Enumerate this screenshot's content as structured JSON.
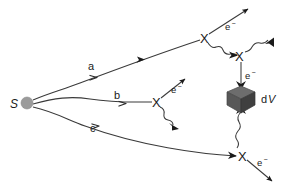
{
  "figure": {
    "background_color": "#ffffff",
    "line_color": "#3a3a3a",
    "label_color": "#1a1a1a",
    "width": 287,
    "height": 191
  },
  "source": {
    "label": "S",
    "dot_color": "#9b9b9b",
    "x": 27,
    "y": 103,
    "radius": 6
  },
  "rays": [
    {
      "label": "a",
      "label_x": 93,
      "label_y": 70
    },
    {
      "label": "b",
      "label_x": 117,
      "label_y": 100
    },
    {
      "label": "c",
      "label_x": 95,
      "label_y": 131
    }
  ],
  "vertices": [
    {
      "name": "vertex-top",
      "label": "X",
      "x": 205,
      "y": 38
    },
    {
      "name": "vertex-upper-right",
      "label": "X",
      "x": 240,
      "y": 56
    },
    {
      "name": "vertex-middle",
      "label": "X",
      "x": 157,
      "y": 102
    },
    {
      "name": "vertex-bottom",
      "label": "X",
      "x": 243,
      "y": 156
    }
  ],
  "electron_labels": [
    {
      "text": "e",
      "sup": "−",
      "x": 230,
      "y": 27,
      "name": "electron-label-top"
    },
    {
      "text": "e",
      "sup": "−",
      "x": 175,
      "y": 90,
      "name": "electron-label-middle"
    },
    {
      "text": "e",
      "sup": "−",
      "x": 246,
      "y": 80,
      "name": "electron-label-cube"
    },
    {
      "text": "e",
      "sup": "−",
      "x": 261,
      "y": 163,
      "name": "electron-label-bottom"
    }
  ],
  "volume_element": {
    "label_prefix": "d",
    "label_italic": "V",
    "label_x": 256,
    "label_y": 101,
    "center_x": 242,
    "center_y": 98,
    "top_color": "#6d6d6d",
    "left_color": "#585858",
    "right_color": "#3f3f3f"
  }
}
